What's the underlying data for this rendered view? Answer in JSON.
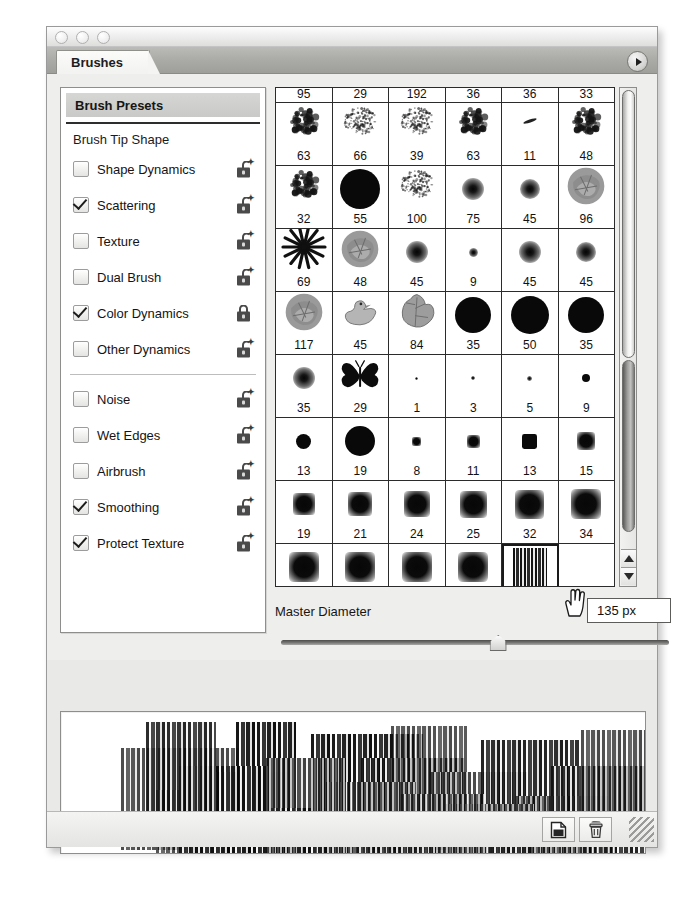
{
  "window": {
    "traffic_lights": [
      "close-button",
      "minimize-button",
      "zoom-button"
    ]
  },
  "tab": {
    "label": "Brushes"
  },
  "panel_menu": {
    "icon": "panel-menu-triangle-icon"
  },
  "sidebar": {
    "presets_header": "Brush Presets",
    "tip_shape": "Brush Tip Shape",
    "group_one": [
      {
        "label": "Shape Dynamics",
        "checked": false,
        "lock": "open"
      },
      {
        "label": "Scattering",
        "checked": true,
        "lock": "open"
      },
      {
        "label": "Texture",
        "checked": false,
        "lock": "open"
      },
      {
        "label": "Dual Brush",
        "checked": false,
        "lock": "open"
      },
      {
        "label": "Color Dynamics",
        "checked": true,
        "lock": "closed"
      },
      {
        "label": "Other Dynamics",
        "checked": false,
        "lock": "open"
      }
    ],
    "group_two": [
      {
        "label": "Noise",
        "checked": false,
        "lock": "open"
      },
      {
        "label": "Wet Edges",
        "checked": false,
        "lock": "open"
      },
      {
        "label": "Airbrush",
        "checked": false,
        "lock": "open"
      },
      {
        "label": "Smoothing",
        "checked": true,
        "lock": "open"
      },
      {
        "label": "Protect Texture",
        "checked": true,
        "lock": "open"
      }
    ]
  },
  "brush_grid": {
    "rows": [
      {
        "partial": true,
        "cells": [
          {
            "size": "95",
            "shape": "splat"
          },
          {
            "size": "29",
            "shape": "spray"
          },
          {
            "size": "192",
            "shape": "splat"
          },
          {
            "size": "36",
            "shape": "splat"
          },
          {
            "size": "36",
            "shape": "dash"
          },
          {
            "size": "33",
            "shape": "splat"
          }
        ]
      },
      {
        "partial": false,
        "cells": [
          {
            "size": "63",
            "shape": "splat"
          },
          {
            "size": "66",
            "shape": "spray"
          },
          {
            "size": "39",
            "shape": "spray"
          },
          {
            "size": "63",
            "shape": "splat"
          },
          {
            "size": "11",
            "shape": "dash"
          },
          {
            "size": "48",
            "shape": "splat"
          }
        ]
      },
      {
        "partial": false,
        "cells": [
          {
            "size": "32",
            "shape": "splat"
          },
          {
            "size": "55",
            "shape": "hard",
            "d": 40
          },
          {
            "size": "100",
            "shape": "spray"
          },
          {
            "size": "75",
            "shape": "soft",
            "d": 22
          },
          {
            "size": "45",
            "shape": "soft",
            "d": 20
          },
          {
            "size": "96",
            "shape": "crumple"
          }
        ]
      },
      {
        "partial": false,
        "cells": [
          {
            "size": "69",
            "shape": "star"
          },
          {
            "size": "48",
            "shape": "crumple"
          },
          {
            "size": "45",
            "shape": "soft",
            "d": 22
          },
          {
            "size": "9",
            "shape": "soft",
            "d": 9
          },
          {
            "size": "45",
            "shape": "soft",
            "d": 22
          },
          {
            "size": "45",
            "shape": "soft",
            "d": 20
          }
        ]
      },
      {
        "partial": false,
        "cells": [
          {
            "size": "117",
            "shape": "crumple"
          },
          {
            "size": "45",
            "shape": "duck"
          },
          {
            "size": "84",
            "shape": "leaf"
          },
          {
            "size": "35",
            "shape": "hard",
            "d": 36
          },
          {
            "size": "50",
            "shape": "hard",
            "d": 38
          },
          {
            "size": "35",
            "shape": "hard",
            "d": 36
          }
        ]
      },
      {
        "partial": false,
        "cells": [
          {
            "size": "35",
            "shape": "soft",
            "d": 22
          },
          {
            "size": "29",
            "shape": "butterfly"
          },
          {
            "size": "1",
            "shape": "soft",
            "d": 3
          },
          {
            "size": "3",
            "shape": "soft",
            "d": 4
          },
          {
            "size": "5",
            "shape": "soft",
            "d": 5
          },
          {
            "size": "9",
            "shape": "hard",
            "d": 8
          }
        ]
      },
      {
        "partial": false,
        "cells": [
          {
            "size": "13",
            "shape": "hard",
            "d": 15
          },
          {
            "size": "19",
            "shape": "hard",
            "d": 30
          },
          {
            "size": "8",
            "shape": "sqsoft",
            "d": 9
          },
          {
            "size": "11",
            "shape": "sqsoft",
            "d": 13
          },
          {
            "size": "13",
            "shape": "sqhard",
            "d": 15
          },
          {
            "size": "15",
            "shape": "sqsoft",
            "d": 18
          }
        ]
      },
      {
        "partial": false,
        "cells": [
          {
            "size": "19",
            "shape": "sqsoft",
            "d": 22
          },
          {
            "size": "21",
            "shape": "sqsoft",
            "d": 24
          },
          {
            "size": "24",
            "shape": "sqsoft",
            "d": 26
          },
          {
            "size": "25",
            "shape": "sqsoft",
            "d": 27
          },
          {
            "size": "32",
            "shape": "sqsoft",
            "d": 29
          },
          {
            "size": "34",
            "shape": "sqsoft",
            "d": 30
          }
        ]
      },
      {
        "partial": false,
        "cells": [
          {
            "size": "40",
            "shape": "sqsoft",
            "d": 30
          },
          {
            "size": "43",
            "shape": "sqsoft",
            "d": 30
          },
          {
            "size": "52",
            "shape": "sqsoft",
            "d": 30
          },
          {
            "size": "58",
            "shape": "sqsoft",
            "d": 30
          },
          {
            "size": "135",
            "shape": "stripe",
            "selected": true
          },
          {
            "size": "",
            "shape": "empty"
          }
        ]
      }
    ]
  },
  "master_diameter": {
    "label": "Master Diameter",
    "value": "135 px",
    "slider_percent": 56
  },
  "bottom_bar": {
    "new_brush_icon": "new-brush-icon",
    "delete_brush_icon": "trash-icon",
    "resize_grip_icon": "resize-grip-icon"
  },
  "cursor": {
    "icon": "hand-cursor-icon"
  }
}
